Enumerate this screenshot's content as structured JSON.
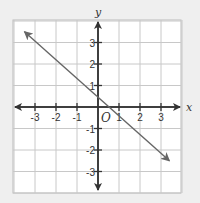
{
  "chart_data": {
    "type": "line",
    "title": "",
    "xlabel": "x",
    "ylabel": "y",
    "origin_label": "O",
    "xlim": [
      -4,
      4
    ],
    "ylim": [
      -4,
      4
    ],
    "grid": true,
    "x_ticks": [
      "-3",
      "-2",
      "-1",
      "1",
      "2",
      "3"
    ],
    "y_ticks": [
      "3",
      "2",
      "1",
      "-1",
      "-2",
      "-3"
    ],
    "series": [
      {
        "name": "line",
        "points": [
          [
            -3.5,
            3.5
          ],
          [
            3.4,
            -2.5
          ]
        ],
        "arrows": "both"
      }
    ]
  },
  "colors": {
    "background": "#efefef",
    "grid_bg": "#ffffff",
    "grid": "#c8c8c8",
    "axis": "#333333",
    "line": "#666666"
  }
}
